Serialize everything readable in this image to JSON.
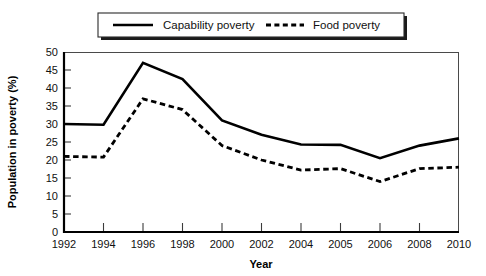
{
  "chart_data": {
    "type": "line",
    "title": "",
    "xlabel": "Year",
    "ylabel": "Population in poverty (%)",
    "categories": [
      "1992",
      "1994",
      "1996",
      "1998",
      "2000",
      "2002",
      "2004",
      "2005",
      "2006",
      "2008",
      "2010"
    ],
    "ylim": [
      0,
      50
    ],
    "yticks": [
      "0",
      "5",
      "10",
      "15",
      "20",
      "25",
      "30",
      "35",
      "40",
      "45",
      "50"
    ],
    "grid": false,
    "legend_position": "top",
    "series": [
      {
        "name": "Capability poverty",
        "style": "solid",
        "color": "#000000",
        "values": [
          30,
          29.8,
          47,
          42.5,
          31,
          27,
          24.3,
          24.2,
          20.5,
          24,
          26
        ]
      },
      {
        "name": "Food poverty",
        "style": "dashed",
        "color": "#000000",
        "values": [
          21,
          20.8,
          37,
          34,
          24,
          20,
          17.2,
          17.6,
          14,
          17.6,
          18
        ]
      }
    ]
  },
  "legend": {
    "items": [
      {
        "label": "Capability poverty",
        "style": "solid"
      },
      {
        "label": "Food poverty",
        "style": "dashed"
      }
    ]
  }
}
